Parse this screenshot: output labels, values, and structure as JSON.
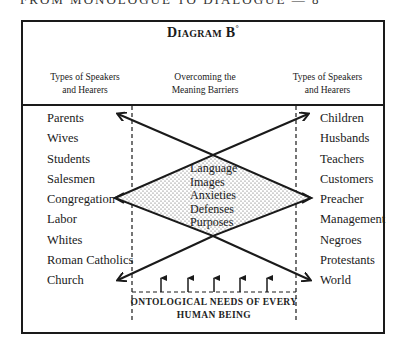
{
  "running_head": "FROM MONOLOGUE TO DIALOGUE — 8",
  "diagram": {
    "title": "Diagram B",
    "title_mark": "°",
    "columns": {
      "left_header": [
        "Types of Speakers",
        "and Hearers"
      ],
      "middle_header": [
        "Overcoming the",
        "Meaning Barriers"
      ],
      "right_header": [
        "Types of Speakers",
        "and Hearers"
      ]
    },
    "left_list": [
      "Parents",
      "Wives",
      "Students",
      "Salesmen",
      "Congregation",
      "Labor",
      "Whites",
      "Roman Catholics",
      "Church"
    ],
    "right_list": [
      "Children",
      "Husbands",
      "Teachers",
      "Customers",
      "Preacher",
      "Management",
      "Negroes",
      "Protestants",
      "World"
    ],
    "barriers": [
      "Language",
      "Images",
      "Anxieties",
      "Defenses",
      "Purposes"
    ],
    "base_label": [
      "ONTOLOGICAL NEEDS OF EVERY",
      "HUMAN BEING"
    ],
    "arrows": {
      "upward_need_arrows": 5,
      "cross_arrows": [
        "Parents",
        "Children",
        "Church",
        "World"
      ],
      "diamond_vertices": [
        "Congregation",
        "Preacher"
      ]
    },
    "colors": {
      "ink": "#1a1a1a",
      "stipple": "#555555",
      "paper": "#ffffff"
    }
  }
}
